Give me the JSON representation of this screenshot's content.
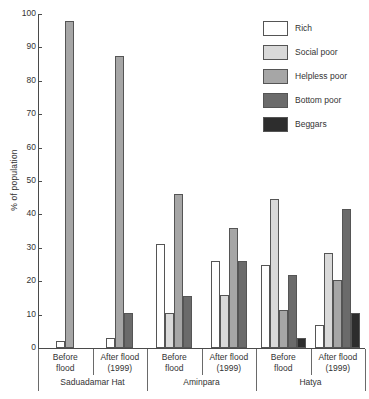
{
  "chart": {
    "type": "bar",
    "ylabel": "% of population"
  },
  "legend": {
    "items": [
      {
        "label": "Rich",
        "color": "#ffffff"
      },
      {
        "label": "Social poor",
        "color": "#d9d9d9"
      },
      {
        "label": "Helpless poor",
        "color": "#a6a6a6"
      },
      {
        "label": "Bottom poor",
        "color": "#6b6b6b"
      },
      {
        "label": "Beggars",
        "color": "#2d2d2d"
      }
    ]
  },
  "yaxis": {
    "ticks": [
      "0",
      "10",
      "20",
      "30",
      "40",
      "50",
      "60",
      "70",
      "80",
      "90",
      "100"
    ]
  },
  "xaxis": {
    "cells": [
      {
        "line1": "Before",
        "line2": "flood"
      },
      {
        "line1": "After flood",
        "line2": "(1999)"
      },
      {
        "line1": "Before",
        "line2": "flood"
      },
      {
        "line1": "After flood",
        "line2": "(1999)"
      },
      {
        "line1": "Before",
        "line2": "flood"
      },
      {
        "line1": "After flood",
        "line2": "(1999)"
      }
    ],
    "locations": [
      "Saduadamar Hat",
      "Aminpara",
      "Hatya"
    ]
  },
  "chart_data": {
    "type": "bar",
    "title": "",
    "xlabel": "",
    "ylabel": "% of population",
    "ylim": [
      0,
      100
    ],
    "ytick_step": 10,
    "grid": false,
    "legend_position": "top-right",
    "categories": [
      "Saduadamar Hat - Before flood",
      "Saduadamar Hat - After flood (1999)",
      "Aminpara - Before flood",
      "Aminpara - After flood (1999)",
      "Hatya - Before flood",
      "Hatya - After flood (1999)"
    ],
    "locations": [
      "Saduadamar Hat",
      "Aminpara",
      "Hatya"
    ],
    "periods": [
      "Before flood",
      "After flood (1999)"
    ],
    "series": [
      {
        "name": "Rich",
        "color": "#ffffff",
        "values": [
          2,
          3,
          31,
          26,
          25,
          7
        ]
      },
      {
        "name": "Social poor",
        "color": "#d9d9d9",
        "values": [
          0,
          0,
          10.5,
          16,
          44.5,
          28.5
        ]
      },
      {
        "name": "Helpless poor",
        "color": "#a6a6a6",
        "values": [
          98,
          87.5,
          46,
          36,
          11.5,
          20.5
        ]
      },
      {
        "name": "Bottom poor",
        "color": "#6b6b6b",
        "values": [
          0,
          10.5,
          15.5,
          26,
          22,
          41.5
        ]
      },
      {
        "name": "Beggars",
        "color": "#2d2d2d",
        "values": [
          0,
          0,
          0,
          0,
          3,
          10.5
        ]
      }
    ]
  }
}
